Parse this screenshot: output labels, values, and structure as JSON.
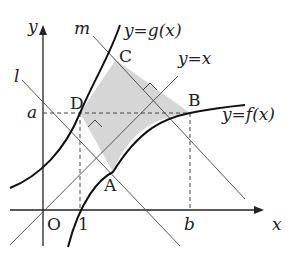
{
  "diagram": {
    "axes": {
      "x_label": "x",
      "y_label": "y",
      "origin_label": "O"
    },
    "ticks": {
      "x_one": "1",
      "x_b": "b",
      "y_a": "a"
    },
    "points": {
      "A": "A",
      "B": "B",
      "C": "C",
      "D": "D"
    },
    "lines": {
      "l": "l",
      "m": "m",
      "identity": "y=x"
    },
    "curves": {
      "f": "y=f(x)",
      "g": "y=g(x)"
    },
    "colors": {
      "stroke": "#222222",
      "shade": "#d4d4d4",
      "thin": "#555555"
    }
  }
}
